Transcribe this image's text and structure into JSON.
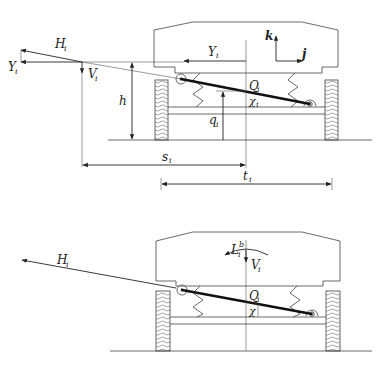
{
  "diagram": {
    "type": "vehicle-suspension-force-diagram",
    "top_panel": {
      "labels": {
        "H": "H",
        "H_sub": "i",
        "Y_left": "Y",
        "Y_left_sub": "i",
        "V": "V",
        "V_sub": "i",
        "h": "h",
        "Y_body": "Y",
        "Y_body_sub": "i",
        "k": "k",
        "j": "j",
        "Q": "Q",
        "Q_sub": "i",
        "chi": "χ",
        "chi_sub": "i",
        "q": "q",
        "q_sub": "i",
        "s": "s",
        "s_sub": "i",
        "t": "t",
        "t_sub": "i"
      }
    },
    "bottom_panel": {
      "labels": {
        "H": "H",
        "H_sub": "i",
        "L": "L",
        "L_sub": "i",
        "L_sup": "b",
        "V": "V",
        "V_sub": "i",
        "Q": "Q",
        "Q_sub": "i",
        "chi": "χ"
      }
    },
    "colors": {
      "line": "#444444",
      "bar": "#111111",
      "background": "#ffffff"
    }
  }
}
